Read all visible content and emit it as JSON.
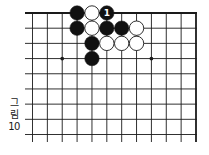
{
  "caption": {
    "line1": "그",
    "line2": "림",
    "line3": "10"
  },
  "board": {
    "description": "Partial Go board, top-right corner region",
    "columns": 12,
    "rows": 9,
    "edges": [
      "top",
      "right"
    ],
    "hoshi": [
      {
        "col": 2,
        "row": 3
      },
      {
        "col": 8,
        "row": 3
      }
    ],
    "stones": [
      {
        "col": 3,
        "row": 0,
        "color": "black"
      },
      {
        "col": 4,
        "row": 0,
        "color": "white"
      },
      {
        "col": 5,
        "row": 0,
        "color": "black",
        "label": "1"
      },
      {
        "col": 3,
        "row": 1,
        "color": "black"
      },
      {
        "col": 4,
        "row": 1,
        "color": "white"
      },
      {
        "col": 5,
        "row": 1,
        "color": "black"
      },
      {
        "col": 6,
        "row": 1,
        "color": "black"
      },
      {
        "col": 7,
        "row": 1,
        "color": "white"
      },
      {
        "col": 4,
        "row": 2,
        "color": "black"
      },
      {
        "col": 5,
        "row": 2,
        "color": "white"
      },
      {
        "col": 6,
        "row": 2,
        "color": "white"
      },
      {
        "col": 7,
        "row": 2,
        "color": "white"
      },
      {
        "col": 4,
        "row": 3,
        "color": "black"
      }
    ],
    "colors": {
      "line": "#1a1a1a",
      "black_stone": "#111111",
      "white_stone": "#ffffff",
      "label_on_black": "#ffffff"
    }
  }
}
